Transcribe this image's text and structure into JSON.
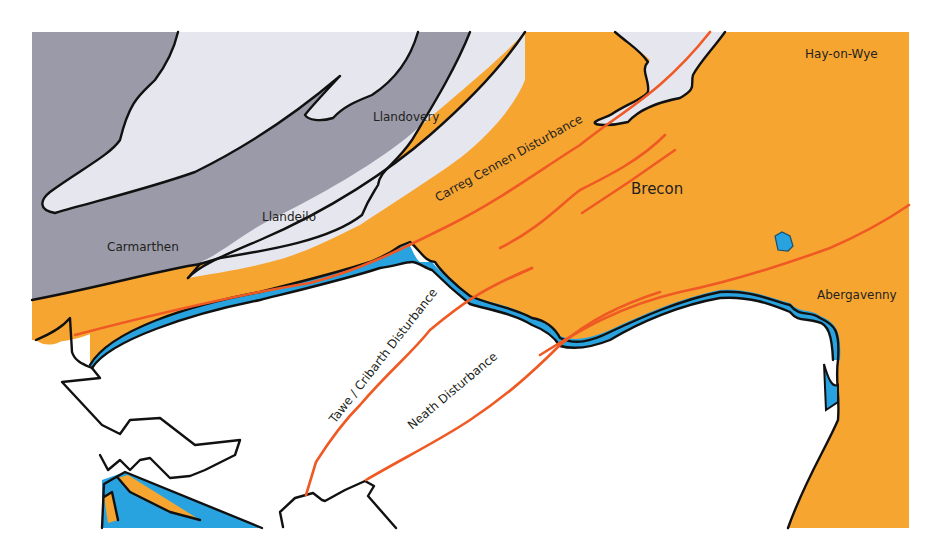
{
  "map": {
    "colors": {
      "old_red_sandstone": "#f7a531",
      "silurian_ordovician": "#9a9aa8",
      "light_band": "#e6e6ef",
      "limestone": "#29a3df",
      "coal_measures": "#ffffff",
      "fault_line": "#ef5a24",
      "outline": "#111111",
      "text": "#231f20"
    },
    "places": [
      {
        "name": "Hay-on-Wye",
        "x": 825,
        "y": 54
      },
      {
        "name": "Llandovery",
        "x": 374,
        "y": 121
      },
      {
        "name": "Brecon",
        "x": 634,
        "y": 194
      },
      {
        "name": "Llandeilo",
        "x": 262,
        "y": 221
      },
      {
        "name": "Carmarthen",
        "x": 107,
        "y": 251
      },
      {
        "name": "Abergavenny",
        "x": 816,
        "y": 297
      }
    ],
    "faults": [
      {
        "name": "Carreg Cennen Disturbance",
        "x": 470,
        "y": 163,
        "angle": -29
      },
      {
        "name": "Tawe / Cribarth Disturbance",
        "x": 378,
        "y": 374,
        "angle": -52
      },
      {
        "name": "Neath Disturbance",
        "x": 453,
        "y": 381,
        "angle": -42
      }
    ]
  }
}
